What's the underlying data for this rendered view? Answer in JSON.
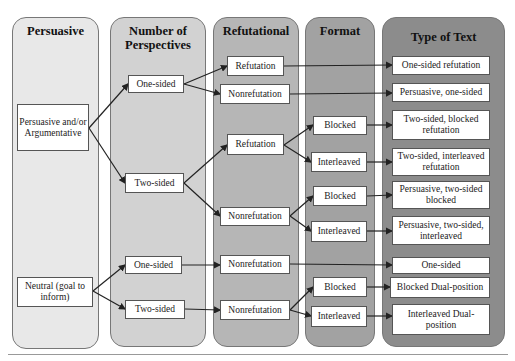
{
  "columns": [
    {
      "id": "persuasive",
      "title": "Persuasive",
      "fill": "#e8e8e8"
    },
    {
      "id": "perspectives",
      "title": "Number of Perspectives",
      "fill": "#d2d2d2"
    },
    {
      "id": "refutational",
      "title": "Refutational",
      "fill": "#b6b6b6"
    },
    {
      "id": "format",
      "title": "Format",
      "fill": "#a2a2a2"
    },
    {
      "id": "type",
      "title": "Type of Text",
      "fill": "#8c8c8c"
    }
  ],
  "nodes": {
    "persuasive_argumentative": "Persuasive and/or Argumentative",
    "neutral": "Neutral (goal to inform)",
    "one_sided_1": "One-sided",
    "two_sided_1": "Two-sided",
    "one_sided_2": "One-sided",
    "two_sided_2": "Two-sided",
    "refutation_1": "Refutation",
    "nonrefutation_1": "Nonrefutation",
    "refutation_2": "Refutation",
    "nonrefutation_2": "Nonrefutation",
    "nonrefutation_3": "Nonrefutation",
    "nonrefutation_4": "Nonrefutation",
    "blocked_1": "Blocked",
    "interleaved_1": "Interleaved",
    "blocked_2": "Blocked",
    "interleaved_2": "Interleaved",
    "blocked_3": "Blocked",
    "interleaved_3": "Interleaved",
    "type_1": "One-sided refutation",
    "type_2": "Persuasive, one-sided",
    "type_3": "Two-sided, blocked refutation",
    "type_4": "Two-sided, interleaved refutation",
    "type_5": "Persuasive, two-sided blocked",
    "type_6": "Persuasive, two-sided, interleaved",
    "type_7": "One-sided",
    "type_8": "Blocked Dual-position",
    "type_9": "Interleaved Dual-position"
  }
}
